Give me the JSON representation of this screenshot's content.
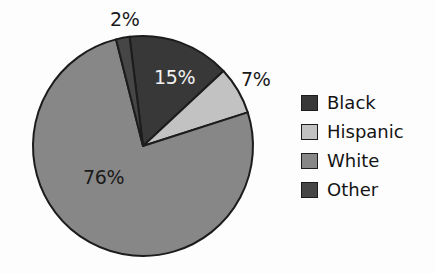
{
  "chart_data": {
    "type": "pie",
    "title": "",
    "subtitle": "",
    "xlabel": "",
    "ylabel": "",
    "categories": [
      "Black",
      "Hispanic",
      "White",
      "Other"
    ],
    "values": [
      15,
      7,
      76,
      2
    ],
    "value_labels": [
      "15%",
      "7%",
      "76%",
      "2%"
    ],
    "units": "percent",
    "legend_position": "right",
    "grid": false,
    "start_angle_deg": -7,
    "direction": "clockwise",
    "slices": [
      {
        "name": "Black",
        "value": 15,
        "label": "15%",
        "color": "#383838",
        "label_color": "#f2f2f2",
        "label_placement": "inside"
      },
      {
        "name": "Hispanic",
        "value": 7,
        "label": "7%",
        "color": "#c2c2c2",
        "label_color": "#1a1a1a",
        "label_placement": "outside"
      },
      {
        "name": "White",
        "value": 76,
        "label": "76%",
        "color": "#878787",
        "label_color": "#1a1a1a",
        "label_placement": "inside"
      },
      {
        "name": "Other",
        "value": 2,
        "label": "2%",
        "color": "#464646",
        "label_color": "#1a1a1a",
        "label_placement": "outside"
      }
    ]
  },
  "legend": {
    "items": [
      {
        "label": "Black",
        "color": "#383838"
      },
      {
        "label": "Hispanic",
        "color": "#c2c2c2"
      },
      {
        "label": "White",
        "color": "#878787"
      },
      {
        "label": "Other",
        "color": "#464646"
      }
    ]
  },
  "labels": {
    "other": "2%",
    "black": "15%",
    "hispanic": "7%",
    "white": "76%"
  },
  "style": {
    "background": "#fdfdfd",
    "outline": "#1c1c1c"
  }
}
